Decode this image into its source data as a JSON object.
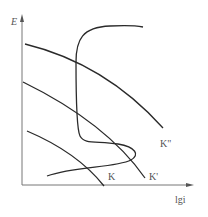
{
  "diagram": {
    "axes": {
      "y_label": "E",
      "x_label": "lgi"
    },
    "curves": [
      {
        "id": "curve-k-double-prime",
        "label": "K\""
      },
      {
        "id": "curve-k-prime",
        "label": "K'"
      },
      {
        "id": "curve-k",
        "label": "K"
      },
      {
        "id": "curve-anodic-polarization",
        "label": ""
      }
    ],
    "colors": {
      "axis": "#777777",
      "curve": "#2a2a2a",
      "label": "#555555"
    }
  }
}
